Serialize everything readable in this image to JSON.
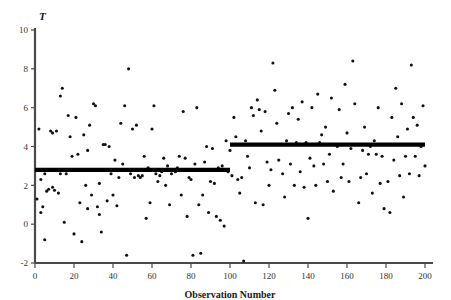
{
  "chart_data": {
    "type": "scatter",
    "title": "",
    "xlabel": "Observation Number",
    "ylabel": "T",
    "xlim": [
      0,
      200
    ],
    "ylim": [
      -2,
      10
    ],
    "xticks": [
      0,
      20,
      40,
      60,
      80,
      100,
      120,
      140,
      160,
      180,
      200
    ],
    "yticks": [
      -2,
      0,
      2,
      4,
      6,
      8,
      10
    ],
    "xtick_labels": [
      "0",
      "20",
      "40",
      "60",
      "80",
      "100",
      "120",
      "140",
      "160",
      "180",
      "200"
    ],
    "ytick_labels": [
      "-2",
      "0",
      "2",
      "4",
      "6",
      "8",
      "10"
    ],
    "grid": false,
    "legend": null,
    "annotations": [
      {
        "name": "mean-level-segment-1",
        "type": "horizontal-segment",
        "x_start": 0,
        "x_end": 100,
        "y": 2.8,
        "color": "#000000"
      },
      {
        "name": "mean-level-segment-2",
        "type": "horizontal-segment",
        "x_start": 100,
        "x_end": 200,
        "y": 4.1,
        "color": "#000000"
      }
    ],
    "series": [
      {
        "name": "T observations",
        "marker": "dot",
        "color": "#111111",
        "points": [
          [
            1,
            1.3
          ],
          [
            2,
            4.9
          ],
          [
            3,
            0.6
          ],
          [
            3,
            2.3
          ],
          [
            4,
            0.9
          ],
          [
            5,
            2.6
          ],
          [
            5,
            -0.8
          ],
          [
            6,
            1.7
          ],
          [
            7,
            1.8
          ],
          [
            8,
            4.8
          ],
          [
            9,
            1.9
          ],
          [
            9,
            4.7
          ],
          [
            10,
            1.75
          ],
          [
            11,
            4.8
          ],
          [
            12,
            1.6
          ],
          [
            13,
            6.6
          ],
          [
            13,
            2.6
          ],
          [
            14,
            7.0
          ],
          [
            15,
            0.1
          ],
          [
            16,
            2.6
          ],
          [
            17,
            5.6
          ],
          [
            18,
            4.5
          ],
          [
            19,
            3.5
          ],
          [
            20,
            -0.5
          ],
          [
            21,
            5.5
          ],
          [
            22,
            3.6
          ],
          [
            23,
            1.1
          ],
          [
            24,
            -0.9
          ],
          [
            25,
            4.6
          ],
          [
            26,
            2.0
          ],
          [
            27,
            0.8
          ],
          [
            27,
            3.8
          ],
          [
            28,
            5.1
          ],
          [
            29,
            1.5
          ],
          [
            30,
            6.2
          ],
          [
            31,
            6.1
          ],
          [
            32,
            0.9
          ],
          [
            33,
            0.5
          ],
          [
            33,
            2.1
          ],
          [
            34,
            -0.4
          ],
          [
            35,
            4.1
          ],
          [
            36,
            4.1
          ],
          [
            37,
            1.2
          ],
          [
            38,
            4.0
          ],
          [
            39,
            2.6
          ],
          [
            40,
            1.5
          ],
          [
            41,
            3.3
          ],
          [
            42,
            0.95
          ],
          [
            43,
            2.4
          ],
          [
            44,
            5.2
          ],
          [
            45,
            3.1
          ],
          [
            46,
            6.1
          ],
          [
            47,
            -1.6
          ],
          [
            48,
            8.0
          ],
          [
            49,
            2.6
          ],
          [
            50,
            4.9
          ],
          [
            51,
            2.4
          ],
          [
            52,
            5.1
          ],
          [
            53,
            2.5
          ],
          [
            54,
            2.4
          ],
          [
            55,
            2.5
          ],
          [
            56,
            3.5
          ],
          [
            57,
            0.3
          ],
          [
            58,
            2.9
          ],
          [
            59,
            1.1
          ],
          [
            60,
            4.9
          ],
          [
            61,
            6.1
          ],
          [
            62,
            2.6
          ],
          [
            63,
            2.2
          ],
          [
            64,
            2.5
          ],
          [
            65,
            2.7
          ],
          [
            66,
            3.4
          ],
          [
            67,
            2.0
          ],
          [
            68,
            3.0
          ],
          [
            69,
            1.0
          ],
          [
            70,
            2.6
          ],
          [
            71,
            2.8
          ],
          [
            72,
            2.7
          ],
          [
            73,
            2.9
          ],
          [
            74,
            3.5
          ],
          [
            75,
            1.5
          ],
          [
            76,
            5.8
          ],
          [
            77,
            3.4
          ],
          [
            78,
            0.4
          ],
          [
            79,
            2.4
          ],
          [
            80,
            2.3
          ],
          [
            81,
            -1.6
          ],
          [
            82,
            3.1
          ],
          [
            83,
            6.0
          ],
          [
            84,
            1.0
          ],
          [
            85,
            -1.5
          ],
          [
            86,
            1.5
          ],
          [
            87,
            3.2
          ],
          [
            88,
            4.0
          ],
          [
            89,
            0.6
          ],
          [
            90,
            2.2
          ],
          [
            91,
            3.9
          ],
          [
            92,
            2.1
          ],
          [
            93,
            0.4
          ],
          [
            94,
            2.9
          ],
          [
            95,
            0.2
          ],
          [
            96,
            3.0
          ],
          [
            97,
            -0.1
          ],
          [
            98,
            4.3
          ],
          [
            99,
            2.7
          ],
          [
            100,
            3.8
          ],
          [
            101,
            2.5
          ],
          [
            102,
            5.5
          ],
          [
            103,
            4.5
          ],
          [
            104,
            2.3
          ],
          [
            105,
            1.6
          ],
          [
            106,
            2.4
          ],
          [
            107,
            -1.9
          ],
          [
            108,
            4.3
          ],
          [
            109,
            3.5
          ],
          [
            110,
            2.9
          ],
          [
            111,
            6.0
          ],
          [
            112,
            5.6
          ],
          [
            113,
            1.1
          ],
          [
            114,
            6.4
          ],
          [
            115,
            5.9
          ],
          [
            116,
            4.8
          ],
          [
            117,
            1.0
          ],
          [
            118,
            5.8
          ],
          [
            119,
            3.2
          ],
          [
            120,
            2.0
          ],
          [
            121,
            2.8
          ],
          [
            122,
            8.3
          ],
          [
            123,
            6.9
          ],
          [
            124,
            5.2
          ],
          [
            125,
            3.3
          ],
          [
            126,
            4.1
          ],
          [
            127,
            2.6
          ],
          [
            128,
            1.4
          ],
          [
            129,
            4.3
          ],
          [
            130,
            5.7
          ],
          [
            131,
            3.1
          ],
          [
            132,
            6.0
          ],
          [
            133,
            2.0
          ],
          [
            134,
            4.2
          ],
          [
            135,
            5.4
          ],
          [
            136,
            2.7
          ],
          [
            137,
            6.3
          ],
          [
            138,
            1.9
          ],
          [
            139,
            4.2
          ],
          [
            140,
            0.3
          ],
          [
            141,
            3.4
          ],
          [
            142,
            6.0
          ],
          [
            143,
            3.0
          ],
          [
            144,
            2.0
          ],
          [
            145,
            6.7
          ],
          [
            146,
            4.2
          ],
          [
            147,
            4.6
          ],
          [
            148,
            3.1
          ],
          [
            149,
            5.0
          ],
          [
            150,
            2.2
          ],
          [
            151,
            3.6
          ],
          [
            152,
            6.5
          ],
          [
            153,
            1.7
          ],
          [
            154,
            4.1
          ],
          [
            155,
            4.0
          ],
          [
            156,
            5.9
          ],
          [
            157,
            2.4
          ],
          [
            158,
            3.1
          ],
          [
            159,
            7.2
          ],
          [
            160,
            4.7
          ],
          [
            161,
            2.2
          ],
          [
            162,
            3.9
          ],
          [
            163,
            8.4
          ],
          [
            164,
            6.2
          ],
          [
            165,
            4.1
          ],
          [
            166,
            1.1
          ],
          [
            167,
            2.4
          ],
          [
            168,
            3.8
          ],
          [
            169,
            5.0
          ],
          [
            170,
            2.6
          ],
          [
            171,
            3.6
          ],
          [
            172,
            4.0
          ],
          [
            173,
            1.6
          ],
          [
            174,
            4.3
          ],
          [
            175,
            3.6
          ],
          [
            176,
            6.0
          ],
          [
            177,
            2.1
          ],
          [
            178,
            3.5
          ],
          [
            179,
            0.8
          ],
          [
            180,
            4.1
          ],
          [
            181,
            2.2
          ],
          [
            182,
            0.6
          ],
          [
            183,
            5.5
          ],
          [
            184,
            3.3
          ],
          [
            185,
            7.0
          ],
          [
            186,
            4.5
          ],
          [
            187,
            2.5
          ],
          [
            188,
            6.2
          ],
          [
            189,
            1.4
          ],
          [
            190,
            3.5
          ],
          [
            191,
            4.9
          ],
          [
            192,
            2.6
          ],
          [
            193,
            8.2
          ],
          [
            194,
            5.5
          ],
          [
            195,
            3.5
          ],
          [
            196,
            5.1
          ],
          [
            197,
            2.5
          ],
          [
            198,
            4.0
          ],
          [
            199,
            6.1
          ],
          [
            200,
            3.0
          ]
        ]
      }
    ]
  },
  "axes": {
    "y_variable_label": "T",
    "x_axis_title": "Observation Number"
  }
}
